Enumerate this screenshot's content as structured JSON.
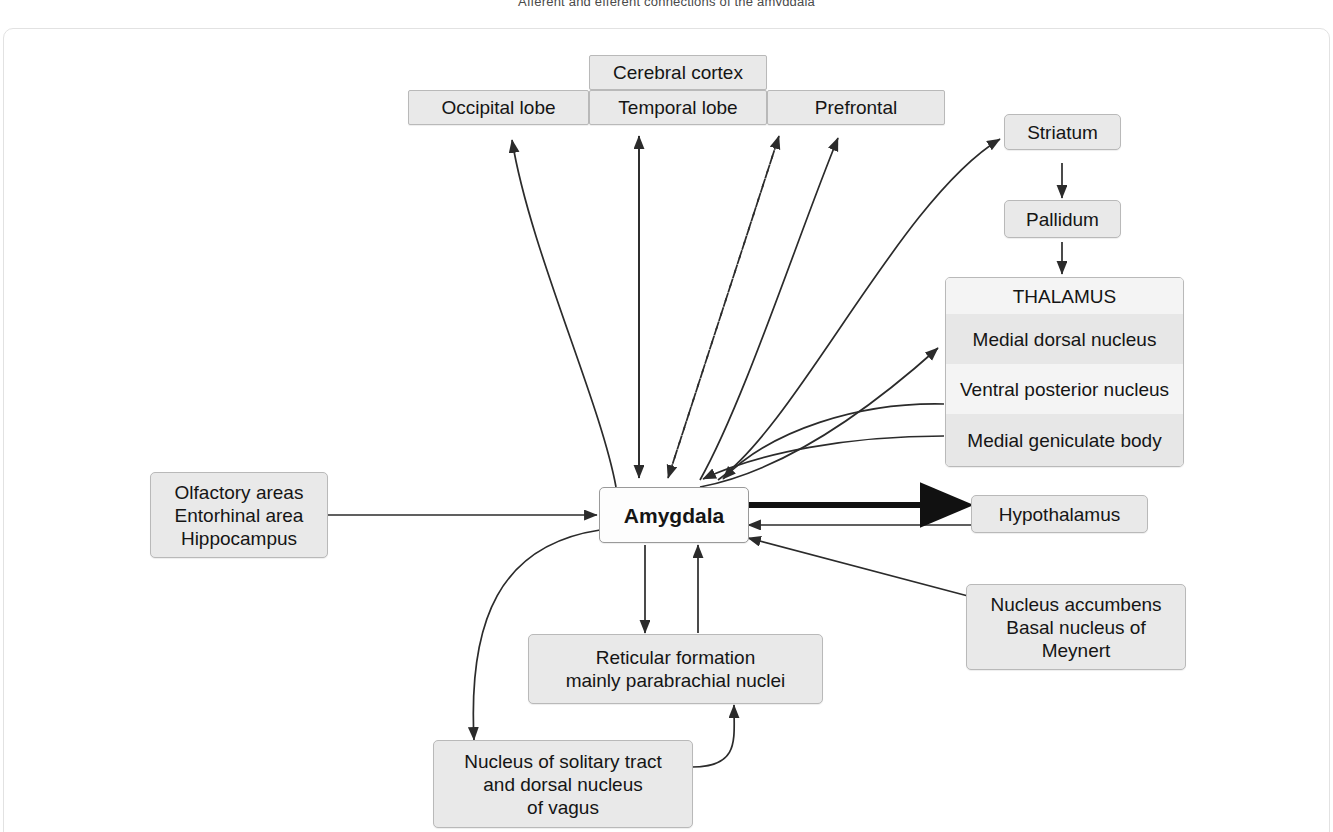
{
  "page": {
    "title": "Afferent and efferent connections of the amygdala",
    "background_color": "#ffffff",
    "node_fill": "#e9e9e9",
    "node_border": "#b9b9b9",
    "accent_node_fill": "#fdfdfd",
    "wire_color": "#2b2b2b"
  },
  "nodes": {
    "cerebral_cortex": "Cerebral cortex",
    "occipital_lobe": "Occipital lobe",
    "temporal_lobe": "Temporal lobe",
    "prefrontal": "Prefrontal",
    "striatum": "Striatum",
    "pallidum": "Pallidum",
    "thalamus_title": "THALAMUS",
    "thalamus_medial_dorsal": "Medial dorsal nucleus",
    "thalamus_ventral_posterior": "Ventral posterior nucleus",
    "thalamus_medial_geniculate": "Medial geniculate body",
    "olfactory_group_line1": "Olfactory areas",
    "olfactory_group_line2": "Entorhinal area",
    "olfactory_group_line3": "Hippocampus",
    "amygdala": "Amygdala",
    "hypothalamus": "Hypothalamus",
    "accumbens_line1": "Nucleus accumbens",
    "accumbens_line2": "Basal nucleus of",
    "accumbens_line3": "Meynert",
    "reticular_line1": "Reticular formation",
    "reticular_line2": "mainly parabrachial nuclei",
    "solitary_line1": "Nucleus of solitary tract",
    "solitary_line2": "and dorsal nucleus",
    "solitary_line3": "of vagus"
  },
  "connections": [
    {
      "from": "Amygdala",
      "to": "Occipital lobe",
      "style": "curved-solid",
      "direction": "one-way"
    },
    {
      "from": "Amygdala",
      "to": "Temporal lobe",
      "style": "straight-solid",
      "direction": "two-way"
    },
    {
      "from": "Amygdala",
      "to": "Temporal lobe (lateral)",
      "style": "dashed",
      "direction": "two-way"
    },
    {
      "from": "Amygdala",
      "to": "Prefrontal",
      "style": "curved-solid",
      "direction": "one-way"
    },
    {
      "from": "Amygdala",
      "to": "Striatum",
      "style": "curved-solid",
      "direction": "one-way"
    },
    {
      "from": "Striatum",
      "to": "Pallidum",
      "style": "straight-solid",
      "direction": "one-way"
    },
    {
      "from": "Pallidum",
      "to": "THALAMUS",
      "style": "straight-solid",
      "direction": "one-way"
    },
    {
      "from": "Amygdala",
      "to": "Medial dorsal nucleus",
      "style": "curved-solid",
      "direction": "one-way"
    },
    {
      "from": "Ventral posterior nucleus",
      "to": "Amygdala",
      "style": "curved-solid",
      "direction": "one-way"
    },
    {
      "from": "Medial geniculate body",
      "to": "Amygdala",
      "style": "curved-solid",
      "direction": "one-way"
    },
    {
      "from": "Olfactory areas / Entorhinal area / Hippocampus",
      "to": "Amygdala",
      "style": "straight-solid",
      "direction": "one-way"
    },
    {
      "from": "Amygdala",
      "to": "Hypothalamus",
      "style": "straight-thick",
      "direction": "one-way"
    },
    {
      "from": "Hypothalamus",
      "to": "Amygdala",
      "style": "straight-solid",
      "direction": "one-way"
    },
    {
      "from": "Nucleus accumbens / Basal nucleus of Meynert",
      "to": "Amygdala",
      "style": "straight-solid",
      "direction": "one-way"
    },
    {
      "from": "Amygdala",
      "to": "Reticular formation",
      "style": "straight-solid",
      "direction": "one-way"
    },
    {
      "from": "Reticular formation",
      "to": "Amygdala",
      "style": "straight-solid",
      "direction": "one-way"
    },
    {
      "from": "Amygdala",
      "to": "Nucleus of solitary tract",
      "style": "curved-solid",
      "direction": "one-way"
    },
    {
      "from": "Nucleus of solitary tract",
      "to": "Reticular formation",
      "style": "curved-solid",
      "direction": "one-way"
    }
  ]
}
